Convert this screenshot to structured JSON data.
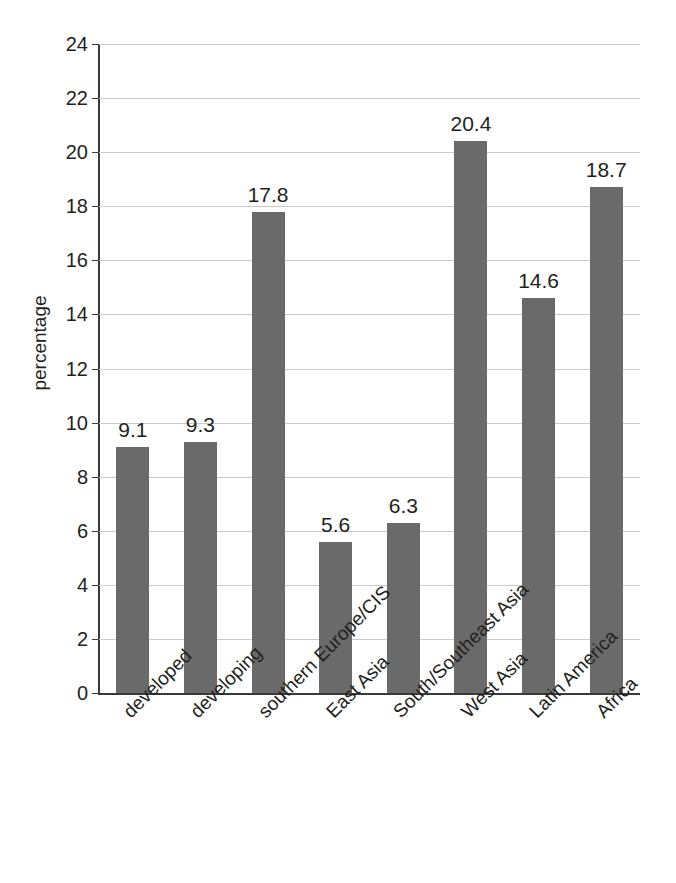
{
  "chart_data": {
    "type": "bar",
    "title": "",
    "subtitle": "",
    "xlabel": "",
    "ylabel": "percentage",
    "ylim": [
      0,
      24
    ],
    "ytick_step": 2,
    "yticks": [
      0,
      2,
      4,
      6,
      8,
      10,
      12,
      14,
      16,
      18,
      20,
      22,
      24
    ],
    "grid": "horizontal",
    "legend": "none",
    "bar_color": "#6a6a6a",
    "gridline_color": "#c9c9c9",
    "axis_color": "#3a3a3a",
    "text_color": "#231f20",
    "categories": [
      "developed",
      "developing",
      "southern Europe/CIS",
      "East Asia",
      "South/Southeast Asia",
      "West Asia",
      "Latin America",
      "Africa"
    ],
    "values": [
      9.1,
      9.3,
      17.8,
      5.6,
      6.3,
      20.4,
      14.6,
      18.7
    ],
    "value_labels": [
      "9.1",
      "9.3",
      "17.8",
      "5.6",
      "6.3",
      "20.4",
      "14.6",
      "18.7"
    ]
  }
}
